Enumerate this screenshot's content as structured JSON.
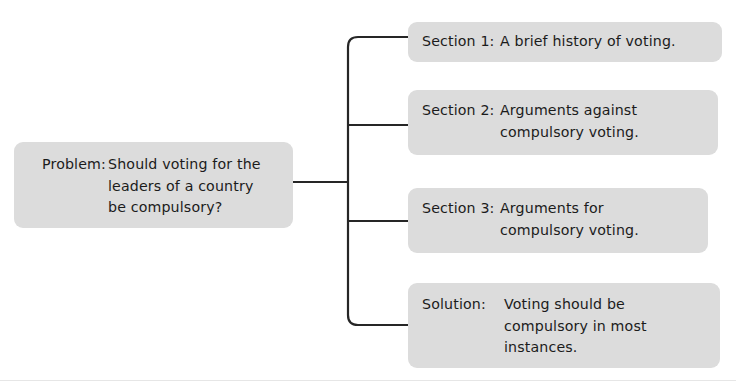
{
  "diagram": {
    "background_color": "#ffffff",
    "node_fill_color": "#dcdcdc",
    "connector_color": "#262626",
    "text_color": "#1b1b1b"
  },
  "problem": {
    "label": "Problem:",
    "text": "Should voting for the\nleaders of a country\nbe compulsory?"
  },
  "branches": [
    {
      "label": "Section 1:",
      "text": "A brief history of voting."
    },
    {
      "label": "Section 2:",
      "text": "Arguments against\ncompulsory voting."
    },
    {
      "label": "Section 3:",
      "text": "Arguments for\ncompulsory voting."
    },
    {
      "label": "Solution:",
      "text": "Voting should be\ncompulsory in most\ninstances."
    }
  ]
}
